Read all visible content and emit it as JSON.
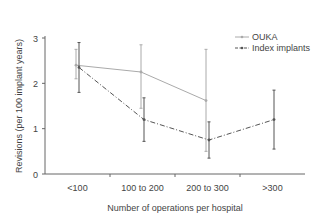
{
  "chart_data": {
    "type": "line",
    "title": "",
    "xlabel": "Number of operations per hospital",
    "ylabel": "Revisions (per 100 implant years)",
    "categories": [
      "<100",
      "100 to 200",
      "200 to 300",
      ">300"
    ],
    "ylim": [
      0,
      3
    ],
    "yticks": [
      "0",
      "1",
      "2",
      "3"
    ],
    "grid": false,
    "legend_position": "top-right",
    "series": [
      {
        "name": "OUKA",
        "style": "solid",
        "color": "#aaaaaa",
        "values": [
          2.4,
          2.25,
          1.62,
          null
        ],
        "error_low": [
          2.1,
          1.45,
          0.5,
          null
        ],
        "error_high": [
          2.75,
          2.85,
          2.75,
          null
        ]
      },
      {
        "name": "Index implants",
        "style": "dash-dot",
        "color": "#555555",
        "values": [
          2.35,
          1.2,
          0.75,
          1.2
        ],
        "error_low": [
          1.8,
          0.72,
          0.35,
          0.55
        ],
        "error_high": [
          2.9,
          1.68,
          1.15,
          1.85
        ]
      }
    ]
  }
}
